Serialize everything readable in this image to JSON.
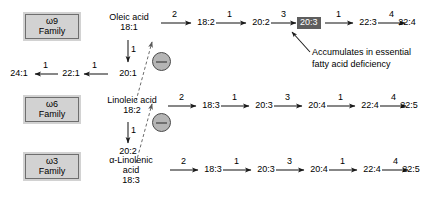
{
  "diagram": {
    "families": [
      {
        "id": "w9",
        "omega": "ω9",
        "word": "Family"
      },
      {
        "id": "w6",
        "omega": "ω6",
        "word": "Family"
      },
      {
        "id": "w3",
        "omega": "ω3",
        "word": "Family"
      }
    ],
    "rows": {
      "omega9": {
        "start_name": "Oleic acid",
        "start_code": "18:1",
        "chain": [
          "18:2",
          "20:2",
          "20:3",
          "22:3",
          "22:4"
        ],
        "highlighted": "20:3",
        "step_labels": [
          "2",
          "1",
          "3",
          "1",
          "4"
        ],
        "branch": {
          "down_label": "1",
          "down_node": "20:1",
          "left_nodes": [
            "22:1",
            "24:1"
          ],
          "left_labels": [
            "1",
            "1"
          ]
        }
      },
      "omega6": {
        "start_name": "Linoleic acid",
        "start_code": "18:2",
        "chain": [
          "18:3",
          "20:3",
          "20:4",
          "22:4",
          "22:5"
        ],
        "step_labels": [
          "2",
          "1",
          "3",
          "1",
          "4"
        ],
        "branch": {
          "down_label": "1",
          "down_node": "20:2"
        }
      },
      "omega3": {
        "start_name": "α-Linolenic",
        "start_name_line2": "acid",
        "start_code": "18:3",
        "chain": [
          "18:3",
          "20:3",
          "20:4",
          "22:4",
          "22:5"
        ],
        "step_labels": [
          "2",
          "1",
          "3",
          "1",
          "4"
        ]
      }
    },
    "annotation": {
      "line1": "Accumulates in essential",
      "line2": "fatty acid deficiency"
    },
    "inhibition": {
      "symbol": "⊖",
      "count": 2
    },
    "colors": {
      "background": "#ffffff",
      "line": "#1a1a1a",
      "family_box_fill": "#d2d2d2",
      "family_box_border": "#6e6e6e",
      "highlight_fill": "#5e5e5e",
      "highlight_text": "#ffffff",
      "inhibit_fill": "#b5b5b5"
    }
  }
}
